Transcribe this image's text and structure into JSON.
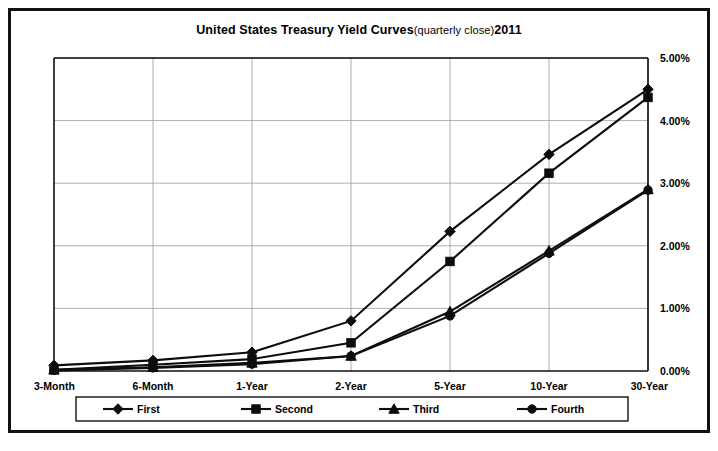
{
  "chart_data": {
    "type": "line",
    "title": "United States Treasury Yield Curves",
    "subtitle": "(quarterly close)",
    "year": "2011",
    "xlabel": "",
    "ylabel": "",
    "categories": [
      "3-Month",
      "6-Month",
      "1-Year",
      "2-Year",
      "5-Year",
      "10-Year",
      "30-Year"
    ],
    "ylim": [
      0,
      5
    ],
    "ytick_labels": [
      "0.00%",
      "1.00%",
      "2.00%",
      "3.00%",
      "4.00%",
      "5.00%"
    ],
    "ytick_values": [
      0,
      1,
      2,
      3,
      4,
      5
    ],
    "grid": true,
    "legend_position": "bottom",
    "series": [
      {
        "name": "First",
        "marker": "diamond",
        "values": [
          0.09,
          0.17,
          0.3,
          0.8,
          2.23,
          3.46,
          4.5
        ]
      },
      {
        "name": "Second",
        "marker": "square",
        "values": [
          0.02,
          0.1,
          0.19,
          0.45,
          1.75,
          3.16,
          4.37
        ]
      },
      {
        "name": "Third",
        "marker": "triangle",
        "values": [
          0.02,
          0.06,
          0.13,
          0.24,
          0.95,
          1.92,
          2.9
        ]
      },
      {
        "name": "Fourth",
        "marker": "circle",
        "values": [
          0.01,
          0.05,
          0.11,
          0.24,
          0.88,
          1.88,
          2.89
        ]
      }
    ]
  },
  "colors": {
    "line": "#0d0d0d",
    "grid": "#9a9a9a",
    "axis": "#111111",
    "background": "#ffffff"
  }
}
